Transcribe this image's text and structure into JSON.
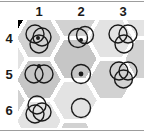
{
  "puzzle": {
    "title": "circle-grid-hexagon-puzzle",
    "column_headers": [
      "1",
      "2",
      "3"
    ],
    "row_headers": [
      "4",
      "5",
      "6"
    ],
    "colors": {
      "stroke": "#1a1a1a",
      "background_white": "#ffffff",
      "hex_light": "#e3e3e3",
      "hex_mid": "#d2d2d2",
      "hex_dark": "#c6c6c6",
      "rule": "#9d9d9d",
      "text": "#1a1a1a"
    },
    "cells": [
      {
        "id": "cell-c1-r4",
        "column": "1",
        "row": "4",
        "circle_count": 3,
        "dot": true,
        "arrangement": "cluster-diagonal",
        "circles": [
          {
            "cx": 17,
            "cy": 14,
            "r": 9
          },
          {
            "cx": 24,
            "cy": 17,
            "r": 9
          },
          {
            "cx": 21,
            "cy": 24,
            "r": 9
          }
        ],
        "dots": [
          {
            "cx": 20,
            "cy": 18,
            "r": 2
          }
        ]
      },
      {
        "id": "cell-c2-r4",
        "column": "2",
        "row": "4",
        "circle_count": 2,
        "dot": true,
        "arrangement": "overlap-horizontal",
        "circles": [
          {
            "cx": 18,
            "cy": 18,
            "r": 9.5
          },
          {
            "cx": 25,
            "cy": 15,
            "r": 8.5
          }
        ],
        "dots": [
          {
            "cx": 21,
            "cy": 20,
            "r": 2
          }
        ]
      },
      {
        "id": "cell-c3-r4",
        "column": "3",
        "row": "4",
        "circle_count": 3,
        "dot": false,
        "arrangement": "two-top-one-bottom",
        "circles": [
          {
            "cx": 16,
            "cy": 14,
            "r": 9
          },
          {
            "cx": 26,
            "cy": 14,
            "r": 9
          },
          {
            "cx": 22,
            "cy": 24,
            "r": 9
          }
        ],
        "dots": []
      },
      {
        "id": "cell-c1-r5",
        "column": "1",
        "row": "5",
        "circle_count": 2,
        "dot": true,
        "arrangement": "overlap-horizontal",
        "circles": [
          {
            "cx": 16,
            "cy": 18,
            "r": 9
          },
          {
            "cx": 26,
            "cy": 18,
            "r": 9
          }
        ],
        "dots": [
          {
            "cx": 21,
            "cy": 10,
            "r": 2
          }
        ]
      },
      {
        "id": "cell-c2-r5",
        "column": "2",
        "row": "5",
        "circle_count": 1,
        "dot": true,
        "arrangement": "single-centered",
        "circles": [
          {
            "cx": 21,
            "cy": 18,
            "r": 9.5
          }
        ],
        "dots": [
          {
            "cx": 21,
            "cy": 18,
            "r": 2.4
          }
        ]
      },
      {
        "id": "cell-c3-r5",
        "column": "3",
        "row": "5",
        "circle_count": 3,
        "dot": false,
        "arrangement": "triangular-venn",
        "circles": [
          {
            "cx": 17,
            "cy": 15,
            "r": 9
          },
          {
            "cx": 26,
            "cy": 15,
            "r": 9
          },
          {
            "cx": 21.5,
            "cy": 23,
            "r": 9
          }
        ],
        "dots": []
      },
      {
        "id": "cell-c1-r6",
        "column": "1",
        "row": "6",
        "circle_count": 3,
        "dot": false,
        "arrangement": "cluster-diagonal",
        "circles": [
          {
            "cx": 19,
            "cy": 13,
            "r": 9
          },
          {
            "cx": 24,
            "cy": 20,
            "r": 9
          },
          {
            "cx": 17,
            "cy": 22,
            "r": 9
          }
        ],
        "dots": []
      },
      {
        "id": "cell-c2-r6",
        "column": "2",
        "row": "6",
        "circle_count": 1,
        "dot": false,
        "arrangement": "single-centered",
        "circles": [
          {
            "cx": 21,
            "cy": 16,
            "r": 9.5
          }
        ],
        "dots": []
      },
      {
        "id": "cell-c3-r6",
        "column": "3",
        "row": "6",
        "circle_count": 0,
        "dot": false,
        "arrangement": "empty",
        "circles": [],
        "dots": []
      }
    ]
  }
}
